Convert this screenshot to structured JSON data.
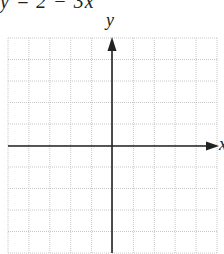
{
  "equation": "y = 2 − 3x",
  "axes": {
    "x_label": "x",
    "y_label": "y"
  },
  "grid": {
    "columns": 10,
    "rows": 10,
    "left": 8,
    "top": 38,
    "right": 217,
    "bottom": 253,
    "axis_x_px": 112,
    "axis_y_px": 146,
    "grid_color": "#c8c8c8",
    "axis_color": "#222222"
  }
}
